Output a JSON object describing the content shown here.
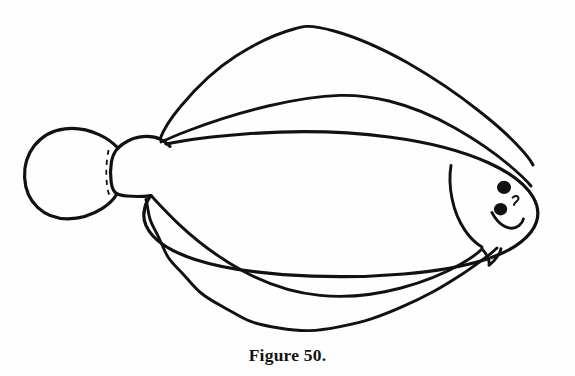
{
  "figure": {
    "caption": "Figure 50.",
    "title": "Figure 50.",
    "background_color": "#fefefe",
    "ink_color": "#111111",
    "style": "black-and-white line art, unfilled outline"
  },
  "illustration": {
    "name": "flatfish",
    "description": "Side-on outline drawing of a flatfish (flounder/plaice type) facing right, with a fan-shaped caudal fin at the left, a long dorsal fin along the top, a long wavy anal fin along the bottom, and a rounded head at the right bearing two eyes.",
    "parts": [
      {
        "id": "caudal-fin",
        "label": "Caudal fin (tail)"
      },
      {
        "id": "caudal-peduncle",
        "label": "Caudal peduncle"
      },
      {
        "id": "peduncle-joint",
        "label": "Peduncle joint (dashed)"
      },
      {
        "id": "dorsal-fin",
        "label": "Dorsal fin"
      },
      {
        "id": "body-outline",
        "label": "Body outline"
      },
      {
        "id": "anal-fin",
        "label": "Anal fin"
      },
      {
        "id": "operculum",
        "label": "Gill cover (operculum)"
      },
      {
        "id": "eye-upper",
        "label": "Upper eye"
      },
      {
        "id": "eye-lower",
        "label": "Lower eye"
      },
      {
        "id": "nostril",
        "label": "Nostril mark"
      },
      {
        "id": "mouth",
        "label": "Mouth"
      }
    ],
    "eye_color": "#111111",
    "eye_count": 2
  }
}
